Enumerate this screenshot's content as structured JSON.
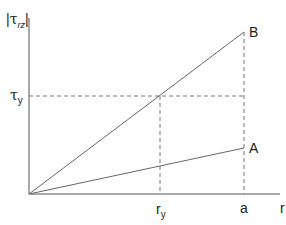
{
  "diagram": {
    "type": "shear stress vs radius",
    "y_axis_label": {
      "symbol": "τ",
      "subscript": "rz",
      "absolute_value": true
    },
    "x_axis_label": "r",
    "yield_stress_label": {
      "symbol": "τ",
      "subscript": "y"
    },
    "x_ticks": [
      {
        "symbol": "r",
        "subscript": "y"
      },
      {
        "symbol": "a",
        "subscript": ""
      }
    ],
    "lines": [
      {
        "name": "B",
        "from": [
          0,
          0
        ],
        "to": [
          "a",
          "above τy"
        ]
      },
      {
        "name": "A",
        "from": [
          0,
          0
        ],
        "to": [
          "a",
          "below τy"
        ]
      }
    ],
    "dashed_guides": [
      "horizontal at τy to r=a",
      "vertical at r=ry",
      "vertical at r=a"
    ],
    "colors": {
      "axis": "#555555",
      "line": "#666666",
      "dashed": "#777777",
      "text": "#222222"
    }
  },
  "labels": {
    "y_abs_left": "|",
    "y_tau": "τ",
    "y_sub": "rz",
    "y_abs_right": "|",
    "ty_tau": "τ",
    "ty_sub": "y",
    "ry_r": "r",
    "ry_sub": "y",
    "a": "a",
    "r": "r",
    "B": "B",
    "A": "A"
  }
}
